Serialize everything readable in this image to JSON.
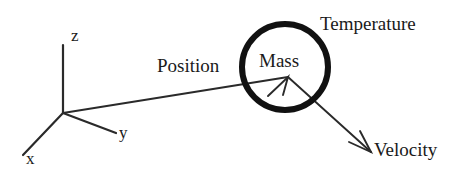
{
  "figure": {
    "background_color": "#ffffff",
    "ink_color": "#1a1a1a",
    "width": 467,
    "height": 177
  },
  "axes": {
    "origin": {
      "x": 63,
      "y": 113
    },
    "labels": {
      "z": "z",
      "y": "y",
      "x": "x"
    },
    "endpoints": {
      "z": {
        "x": 63,
        "y": 45
      },
      "y": {
        "x": 116,
        "y": 133
      },
      "x": {
        "x": 23,
        "y": 155
      }
    }
  },
  "particle": {
    "label": "Mass",
    "center": {
      "x": 285,
      "y": 67
    },
    "radius": 45,
    "stroke_width": 6,
    "stroke_color": "#111111"
  },
  "vectors": {
    "position": {
      "label": "Position",
      "from": {
        "x": 63,
        "y": 113
      },
      "to": {
        "x": 288,
        "y": 77
      },
      "arrowhead": true
    },
    "velocity": {
      "label": "Velocity",
      "from": {
        "x": 288,
        "y": 77
      },
      "to": {
        "x": 371,
        "y": 152
      },
      "arrowhead": true
    }
  },
  "annotations": {
    "temperature": "Temperature"
  }
}
